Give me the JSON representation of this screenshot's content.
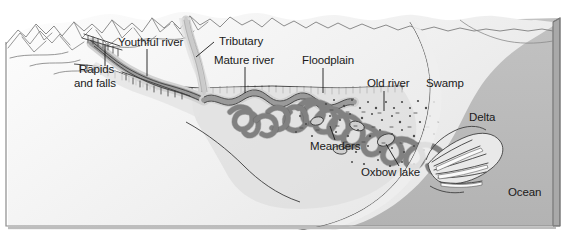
{
  "figure": {
    "background_color": "#ffffff",
    "frame_color": "#8c8c8c"
  },
  "palette": {
    "paper": "#ffffff",
    "upland_fill": "#f2f2f2",
    "mountain_fill": "#fbfbfb",
    "valley_fill": "#e8e8e8",
    "floodplain_fill": "#e0e0e0",
    "lowland_fill": "#dcdcdc",
    "beach_fill": "#ededed",
    "ocean_fill": "#b9b9b9",
    "river_channel": "#8a8a8a",
    "river_outline": "#4a4a4a",
    "ink": "#1a1a1a",
    "hairline": "#6e6e6e"
  },
  "labels": [
    {
      "id": "rapids-and-falls",
      "name": "Rapids and falls",
      "line1": "Rapids",
      "line2": "and falls",
      "text_x": 79,
      "text_y": 73,
      "leader": {
        "x1": 105,
        "y1": 66,
        "x2": 105,
        "y2": 44
      }
    },
    {
      "id": "youthful-river",
      "name": "Youthful river",
      "line1": "Youthful river",
      "line2": "",
      "text_x": 118,
      "text_y": 46,
      "leader": {
        "x1": 147,
        "y1": 49,
        "x2": 147,
        "y2": 76
      }
    },
    {
      "id": "tributary",
      "name": "Tributary",
      "line1": "Tributary",
      "line2": "",
      "text_x": 216,
      "text_y": 45,
      "leader": {
        "x1": 214,
        "y1": 42,
        "x2": 196,
        "y2": 57
      }
    },
    {
      "id": "mature-river",
      "name": "Mature river",
      "line1": "Mature river",
      "line2": "",
      "text_x": 214,
      "text_y": 64,
      "leader": {
        "x1": 245,
        "y1": 67,
        "x2": 245,
        "y2": 93
      }
    },
    {
      "id": "floodplain",
      "name": "Floodplain",
      "line1": "Floodplain",
      "line2": "",
      "text_x": 302,
      "text_y": 64,
      "leader": {
        "x1": 323,
        "y1": 68,
        "x2": 323,
        "y2": 93
      }
    },
    {
      "id": "old-river",
      "name": "Old river",
      "line1": "Old river",
      "line2": "",
      "text_x": 372,
      "text_y": 87,
      "leader": {
        "x1": 384,
        "y1": 91,
        "x2": 384,
        "y2": 111
      }
    },
    {
      "id": "swamp",
      "name": "Swamp",
      "line1": "Swamp",
      "line2": "",
      "text_x": 428,
      "text_y": 87,
      "leader": null
    },
    {
      "id": "delta",
      "name": "Delta",
      "line1": "Delta",
      "line2": "",
      "text_x": 470,
      "text_y": 121,
      "leader": null
    },
    {
      "id": "meanders",
      "name": "Meanders",
      "line1": "Meanders",
      "line2": "",
      "text_x": 313,
      "text_y": 148,
      "leader": {
        "x1": 335,
        "y1": 140,
        "x2": 330,
        "y2": 128
      }
    },
    {
      "id": "oxbow-lake",
      "name": "Oxbow lake",
      "line1": "Oxbow lake",
      "line2": "",
      "text_x": 362,
      "text_y": 174,
      "leader": {
        "x1": 399,
        "y1": 166,
        "x2": 386,
        "y2": 143
      }
    },
    {
      "id": "ocean",
      "name": "Ocean",
      "line1": "Ocean",
      "line2": "",
      "text_x": 510,
      "text_y": 195,
      "leader": null
    }
  ],
  "features": {
    "mountains_label": "mountain range",
    "ocean_label": "ocean water body",
    "delta_label": "river delta distributaries",
    "swamp_label": "swamp stipple marsh",
    "oxbow_label": "oxbow lake cutoff",
    "meander_label": "meander belt"
  }
}
